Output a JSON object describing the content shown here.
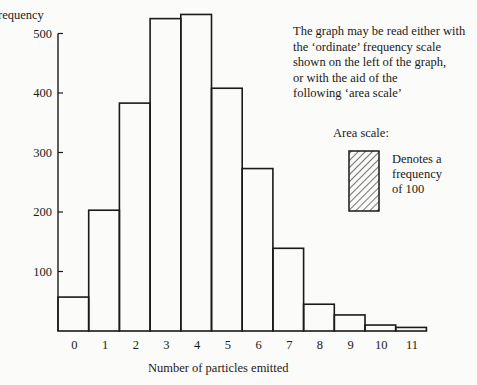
{
  "chart_data": {
    "type": "bar",
    "title": "",
    "xlabel": "Number of particles emitted",
    "ylabel": "Frequency",
    "categories": [
      "0",
      "1",
      "2",
      "3",
      "4",
      "5",
      "6",
      "7",
      "8",
      "9",
      "10",
      "11"
    ],
    "values": [
      57,
      203,
      383,
      525,
      532,
      408,
      273,
      139,
      45,
      27,
      10,
      6
    ],
    "yticks": [
      100,
      200,
      300,
      400,
      500
    ],
    "ylim": [
      0,
      550
    ],
    "grid": false,
    "legend": "none",
    "bar_style": "histogram, outlined, no fill",
    "annotations": [
      "The graph may be read either with the ‘ordinate’ frequency scale shown on the left of the graph, or with the aid of the following ‘area scale’",
      "Area scale:",
      "Denotes a frequency of 100"
    ]
  },
  "labels": {
    "ylabel_visible": "requency",
    "xlabel": "Number of particles emitted",
    "note": "The graph may be read either with\nthe ‘ordinate’ frequency scale\nshown on the left of the graph,\nor with the aid of the\nfollowing ‘area scale’",
    "area_title": "Area scale:",
    "area_desc": "Denotes a\nfrequency\nof 100"
  },
  "colors": {
    "ink": "#1a1a1a",
    "paper": "#fbfbf9"
  }
}
